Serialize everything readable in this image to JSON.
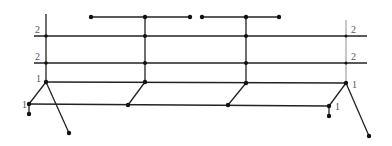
{
  "diagram": {
    "type": "graph",
    "colors": {
      "line": "#222222",
      "node": "#111111",
      "label": "#555555",
      "right_spine": "#9a9a9a"
    },
    "labels": {
      "left_upper": "2",
      "left_middle": "2",
      "left_lower": "1",
      "left_base": "1",
      "right_upper": "2",
      "right_middle": "2",
      "right_lower": "1",
      "right_base": "1"
    },
    "levels": [
      {
        "name": "top-bar-left",
        "y": 17,
        "x_from": 91,
        "x_to": 190
      },
      {
        "name": "top-bar-right",
        "y": 17,
        "x_from": 202,
        "x_to": 279
      },
      {
        "name": "level-2-upper",
        "y": 36,
        "x_from": 34,
        "x_to": 367,
        "label": "2"
      },
      {
        "name": "level-2-middle",
        "y": 63,
        "x_from": 34,
        "x_to": 367,
        "label": "2"
      },
      {
        "name": "level-1",
        "y": 82,
        "x_from": 46,
        "x_to": 346,
        "label": "1"
      },
      {
        "name": "level-1-base",
        "y": 105,
        "x_from": 29,
        "x_to": 329,
        "label": "1"
      }
    ],
    "nodes": [
      [
        91,
        17
      ],
      [
        145,
        17
      ],
      [
        190,
        17
      ],
      [
        202,
        17
      ],
      [
        246,
        17
      ],
      [
        279,
        17
      ],
      [
        46,
        36
      ],
      [
        145,
        36
      ],
      [
        246,
        36
      ],
      [
        346,
        36
      ],
      [
        46,
        63
      ],
      [
        145,
        63
      ],
      [
        246,
        63
      ],
      [
        346,
        63
      ],
      [
        46,
        82
      ],
      [
        145,
        82
      ],
      [
        246,
        83
      ],
      [
        346,
        83
      ],
      [
        29,
        104
      ],
      [
        128,
        105
      ],
      [
        228,
        105
      ],
      [
        329,
        106
      ],
      [
        29,
        114
      ],
      [
        329,
        116
      ],
      [
        69,
        133
      ],
      [
        369,
        136
      ]
    ]
  }
}
